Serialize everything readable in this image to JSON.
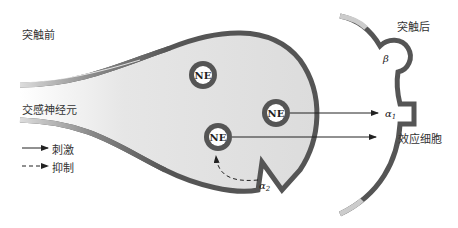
{
  "diagram": {
    "labels": {
      "presynaptic": "突触前",
      "postsynaptic": "突触后",
      "sympathetic_neuron": "交感神经元",
      "effector_cell": "效应细胞"
    },
    "vesicles": [
      {
        "label": "NE",
        "cx": 203,
        "cy": 75
      },
      {
        "label": "NE",
        "cx": 276,
        "cy": 113
      },
      {
        "label": "NE",
        "cx": 218,
        "cy": 137
      }
    ],
    "receptors": {
      "alpha1": "α",
      "alpha1_sub": "1",
      "alpha2": "α",
      "alpha2_sub": "2",
      "beta": "β"
    },
    "legend": [
      {
        "style": "solid",
        "label": "刺激"
      },
      {
        "style": "dashed",
        "label": "抑制"
      }
    ],
    "colors": {
      "membrane": "#555555",
      "cytoplasm": "#e2e2e2",
      "vesicle_ring": "#555555",
      "arrow": "#222222"
    }
  }
}
